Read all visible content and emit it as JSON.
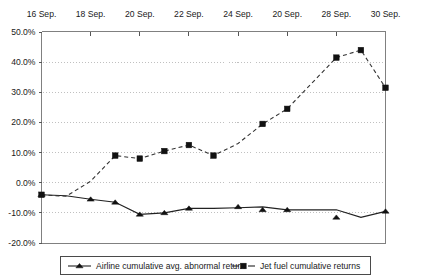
{
  "chart_data": {
    "type": "line",
    "title": "",
    "subtitle": "",
    "xlabel": "",
    "ylabel": "",
    "grid": "horizontal-dotted",
    "legend_position": "bottom",
    "xlim_labels": [
      "16 Sep.",
      "30 Sep."
    ],
    "ylim": [
      -20,
      50
    ],
    "y_ticks": [
      50,
      40,
      30,
      20,
      10,
      0,
      -10,
      -20
    ],
    "y_tick_labels": [
      "50.0%",
      "40.0%",
      "30.0%",
      "20.0%",
      "10.0%",
      "0.0%",
      "-10.0%",
      "-20.0%"
    ],
    "x_tick_labels": [
      "16 Sep.",
      "18 Sep.",
      "20 Sep.",
      "22 Sep.",
      "24 Sep.",
      "20 Sep.",
      "28 Sep.",
      "30 Sep."
    ],
    "x_positions": [
      0,
      2,
      4,
      6,
      8,
      10,
      12,
      14
    ],
    "x_axis_on_top": true,
    "x": [
      0,
      1,
      2,
      3,
      4,
      5,
      6,
      7,
      8,
      9,
      10,
      11,
      12,
      13,
      14
    ],
    "series": [
      {
        "name": "Airline cumulative avg. abnormal return",
        "marker": "triangle",
        "line_style": "solid",
        "color": "#111111",
        "values": [
          -4.0,
          -4.3,
          -5.5,
          -6.5,
          -10.5,
          -10.0,
          -8.5,
          -8.5,
          -8.3,
          -8.0,
          -9.0,
          -9.0,
          -9.0,
          -11.5,
          -9.5
        ]
      },
      {
        "name": "Jet fuel cumulative returns",
        "marker": "square",
        "line_style": "dashed",
        "color": "#111111",
        "values": [
          -4.0,
          -4.5,
          0.5,
          9.0,
          8.0,
          10.5,
          12.5,
          9.0,
          13.0,
          19.5,
          24.5,
          33.0,
          41.5,
          44.0,
          31.5
        ]
      }
    ],
    "marker_points": {
      "airline": [
        {
          "x": 0,
          "y": -4.0
        },
        {
          "x": 2,
          "y": -5.5
        },
        {
          "x": 3,
          "y": -6.5
        },
        {
          "x": 4,
          "y": -10.5
        },
        {
          "x": 5,
          "y": -10.0
        },
        {
          "x": 6,
          "y": -8.5
        },
        {
          "x": 8,
          "y": -8.0
        },
        {
          "x": 9,
          "y": -9.0
        },
        {
          "x": 10,
          "y": -9.0
        },
        {
          "x": 12,
          "y": -11.5
        },
        {
          "x": 14,
          "y": -9.5
        }
      ],
      "jetfuel": [
        {
          "x": 0,
          "y": -4.0
        },
        {
          "x": 3,
          "y": 9.0
        },
        {
          "x": 4,
          "y": 8.0
        },
        {
          "x": 5,
          "y": 10.5
        },
        {
          "x": 6,
          "y": 12.5
        },
        {
          "x": 7,
          "y": 9.0
        },
        {
          "x": 9,
          "y": 19.5
        },
        {
          "x": 10,
          "y": 24.5
        },
        {
          "x": 12,
          "y": 41.5
        },
        {
          "x": 13,
          "y": 44.0
        },
        {
          "x": 14,
          "y": 31.5
        }
      ]
    }
  },
  "legend": {
    "items": [
      {
        "label": "Airline cumulative avg. abnormal return",
        "marker": "triangle",
        "style": "solid"
      },
      {
        "label": "Jet fuel cumulative returns",
        "marker": "square",
        "style": "dashed"
      }
    ]
  },
  "colors": {
    "axis": "#808080",
    "grid": "#b9b9b9",
    "series": "#111111",
    "text": "#1a1a1a",
    "background": "#ffffff"
  }
}
